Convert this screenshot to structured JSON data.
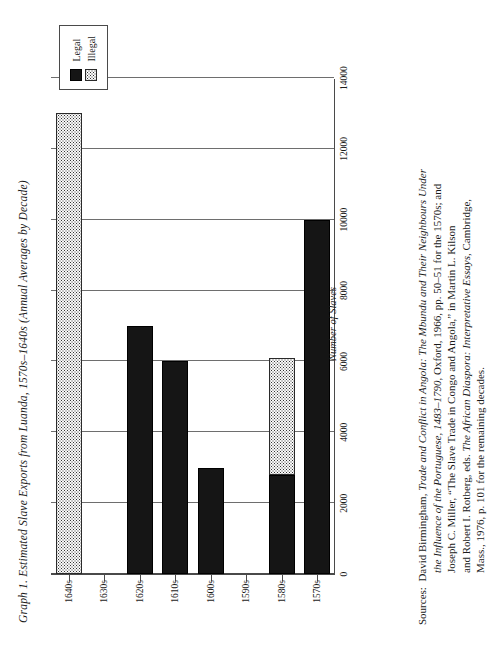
{
  "figure": {
    "title": "Graph 1. Estimated Slave Exports from Luanda, 1570s–1640s (Annual Averages by Decade)"
  },
  "legend": {
    "position": "top-right",
    "items": [
      {
        "label": "Legal",
        "pattern": "solid-black",
        "color": "#151515"
      },
      {
        "label": "Illegal",
        "pattern": "stippled",
        "color": "#fafafa"
      }
    ]
  },
  "axes": {
    "value_axis_title": "Number of Slaves",
    "value_ticks": [
      "0",
      "2000",
      "4000",
      "6000",
      "8000",
      "10000",
      "12000",
      "14000"
    ],
    "category_ticks": [
      "1570s",
      "1580s",
      "1590s",
      "1600s",
      "1610s",
      "1620s",
      "1630s",
      "1640s"
    ]
  },
  "sources": {
    "lead": "Sources:",
    "lines": [
      "David Birmingham, Trade and Conflict in Angola: The Mbundu and Their Neighbours Under",
      "the Influence of the Portuguese, 1483–1790, Oxford, 1966, pp. 50–51 for the 1570s; and",
      "Joseph C. Miller, “The Slave Trade in Congo and Angola,” in Martin L. Kilson",
      "and Robert I. Rotberg, eds. The African Diaspora: Interpretative Essays, Cambridge,",
      "Mass., 1976, p. 101 for the remaining decades."
    ]
  },
  "chart_data": {
    "type": "bar",
    "orientation": "horizontal",
    "title": "Graph 1. Estimated Slave Exports from Luanda, 1570s–1640s (Annual Averages by Decade)",
    "xlabel": "Number of Slaves",
    "ylabel": "",
    "xlim": [
      0,
      14000
    ],
    "xticks": [
      0,
      2000,
      4000,
      6000,
      8000,
      10000,
      12000,
      14000
    ],
    "grid": true,
    "stacked": true,
    "legend_position": "top-right",
    "categories": [
      "1570s",
      "1580s",
      "1590s",
      "1600s",
      "1610s",
      "1620s",
      "1630s",
      "1640s"
    ],
    "series": [
      {
        "name": "Legal",
        "values": [
          10000,
          2800,
          0,
          3000,
          6000,
          7000,
          0,
          0
        ]
      },
      {
        "name": "Illegal",
        "values": [
          0,
          3300,
          0,
          0,
          0,
          0,
          0,
          13000
        ]
      }
    ]
  }
}
